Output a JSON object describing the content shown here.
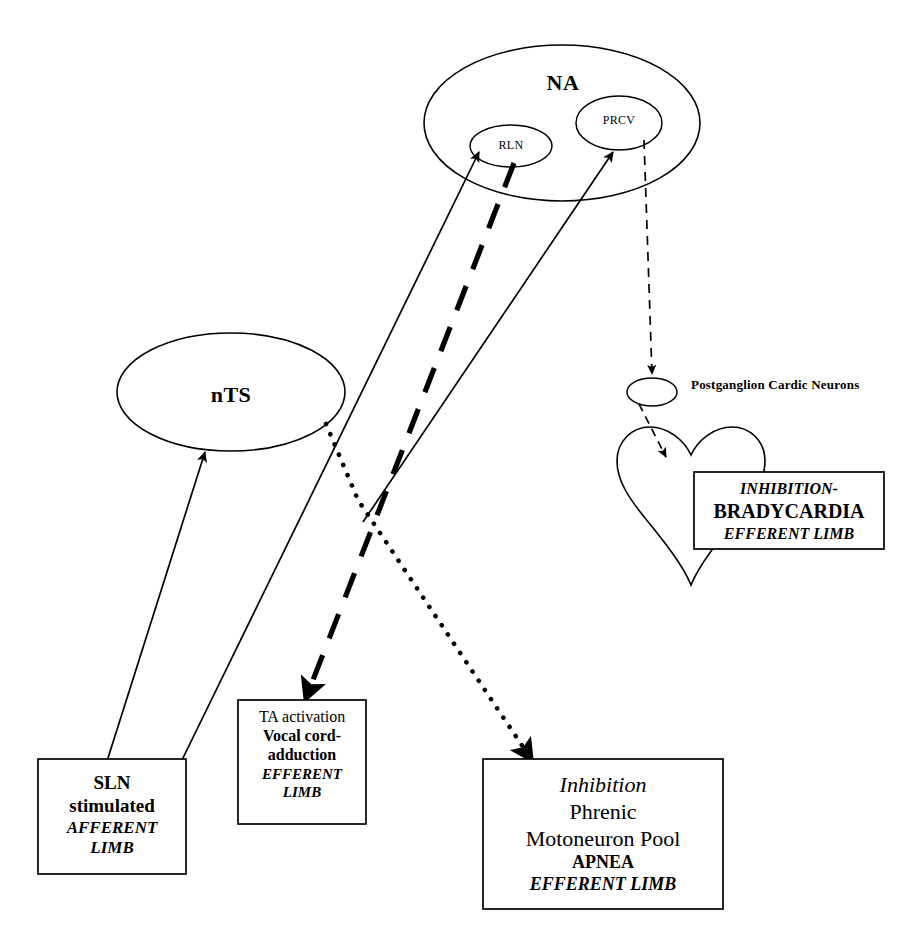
{
  "diagram": {
    "stroke_color": "#000000",
    "background_color": "#ffffff"
  },
  "nodes": {
    "na": {
      "label": "NA",
      "shape": "ellipse"
    },
    "rln": {
      "label": "RLN",
      "shape": "ellipse"
    },
    "prcv": {
      "label": "PRCV",
      "shape": "ellipse"
    },
    "nts": {
      "label": "nTS",
      "shape": "ellipse"
    },
    "ganglion": {
      "label": "",
      "shape": "ellipse"
    },
    "ganglion_caption": {
      "label": "Postganglion Cardic Neurons"
    },
    "heart": {
      "label": "",
      "shape": "heart"
    }
  },
  "boxes": {
    "sln": {
      "name": "sln-stimulated-box",
      "lines": [
        {
          "text": "SLN",
          "style": "bold"
        },
        {
          "text": "stimulated",
          "style": "bold"
        },
        {
          "text": "AFFERENT",
          "style": "bolditalic"
        },
        {
          "text": "LIMB",
          "style": "bolditalic"
        }
      ]
    },
    "ta": {
      "name": "ta-activation-box",
      "lines": [
        {
          "text": "TA activation",
          "style": "plain"
        },
        {
          "text": "Vocal cord-",
          "style": "bold"
        },
        {
          "text": "adduction",
          "style": "bold"
        },
        {
          "text": "EFFERENT",
          "style": "bolditalic"
        },
        {
          "text": "LIMB",
          "style": "bolditalic"
        }
      ]
    },
    "phrenic": {
      "name": "phrenic-inhibition-box",
      "lines": [
        {
          "text": "Inhibition",
          "style": "italic"
        },
        {
          "text": "Phrenic",
          "style": "plain"
        },
        {
          "text": "Motoneuron Pool",
          "style": "plain"
        },
        {
          "text": "APNEA",
          "style": "bold"
        },
        {
          "text": "EFFERENT LIMB",
          "style": "bolditalic"
        }
      ]
    },
    "brady": {
      "name": "bradycardia-box",
      "lines": [
        {
          "text": "INHIBITION-",
          "style": "bolditalic"
        },
        {
          "text": "BRADYCARDIA",
          "style": "bold"
        },
        {
          "text": "EFFERENT LIMB",
          "style": "bolditalic"
        }
      ]
    }
  },
  "connections": [
    {
      "name": "sln-to-nts",
      "from": "sln",
      "to": "nts",
      "line_style": "solid",
      "arrow": true
    },
    {
      "name": "sln-to-rln",
      "from": "sln",
      "to": "rln",
      "line_style": "solid",
      "arrow": true
    },
    {
      "name": "phrenic-area-to-prcv",
      "from": "lower-left",
      "to": "prcv",
      "line_style": "solid",
      "arrow": true
    },
    {
      "name": "rln-to-ta-activation",
      "from": "rln",
      "to": "ta",
      "line_style": "thick-dashed",
      "arrow": true
    },
    {
      "name": "nts-to-phrenic-inhibition",
      "from": "nts",
      "to": "phrenic",
      "line_style": "dotted",
      "arrow": true
    },
    {
      "name": "prcv-to-ganglion",
      "from": "prcv",
      "to": "ganglion",
      "line_style": "dashed",
      "arrow": true
    },
    {
      "name": "ganglion-to-heart",
      "from": "ganglion",
      "to": "heart",
      "line_style": "dashed",
      "arrow": true
    }
  ]
}
